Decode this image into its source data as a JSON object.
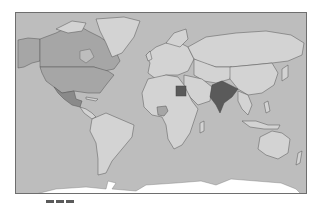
{
  "map": {
    "type": "choropleth-world",
    "colors": {
      "ocean": "#bdbdbd",
      "land_default": "#d3d3d3",
      "level_low": "#a6a6a6",
      "level_mid": "#8a8a8a",
      "level_high": "#5a5a5a",
      "antarctica": "#ffffff",
      "border": "#555555"
    },
    "highlighted_countries": [
      {
        "name": "Canada",
        "level": "low"
      },
      {
        "name": "United States",
        "level": "low"
      },
      {
        "name": "Mexico",
        "level": "mid"
      },
      {
        "name": "Nigeria",
        "level": "low"
      },
      {
        "name": "Egypt",
        "level": "high"
      },
      {
        "name": "India",
        "level": "high"
      }
    ]
  },
  "legend": {
    "swatches": [
      "#5a5a5a",
      "#5a5a5a",
      "#5a5a5a"
    ]
  }
}
